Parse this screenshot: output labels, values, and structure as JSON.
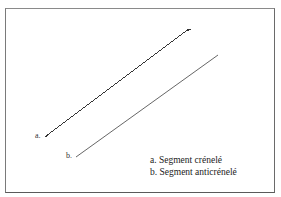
{
  "diagram": {
    "labels": {
      "a": "a.",
      "b": "b."
    },
    "legend": [
      "a. Segment crénelé",
      "b. Segment anticrénelé"
    ],
    "segments": [
      {
        "id": "a",
        "name": "Segment crénelé",
        "x1": 45,
        "y1": 137,
        "x2": 191,
        "y2": 29,
        "style": "aliased"
      },
      {
        "id": "b",
        "name": "Segment anticrénelé",
        "x1": 76,
        "y1": 157,
        "x2": 218,
        "y2": 55,
        "style": "antialiased"
      }
    ],
    "colors": {
      "line_a": "#333333",
      "line_b": "#555555",
      "frame": "#707070",
      "background": "#ffffff"
    }
  }
}
